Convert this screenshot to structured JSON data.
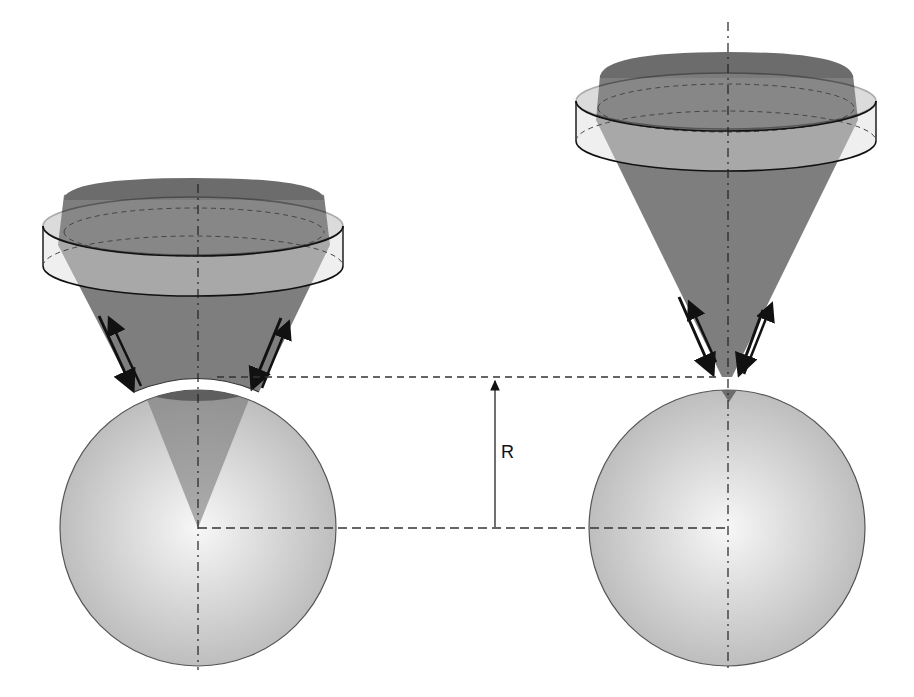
{
  "diagram": {
    "radius_label": "R",
    "colors": {
      "cone": "#6f6f6f",
      "cone_opacity": 0.85,
      "sphere_light": "#f4f4f4",
      "sphere_dark": "#b9b9b9",
      "cap": "#5a5a5a",
      "lens_fill": "#d8d8d8",
      "line": "#111111",
      "dash": "#333333"
    },
    "left_setup": {
      "name": "lens focused to sphere center",
      "axis_x": 198,
      "sphere": {
        "cx": 198,
        "cy": 528,
        "r": 138
      },
      "cone_apex": [
        198,
        528
      ],
      "lens": {
        "cx": 193,
        "top_cy": 226,
        "bottom_cy": 266,
        "rx": 150,
        "ry": 30
      }
    },
    "right_setup": {
      "name": "lens focused to sphere surface",
      "axis_x": 728,
      "sphere": {
        "cx": 727,
        "cy": 528,
        "r": 138
      },
      "cone_apex": [
        729,
        402
      ],
      "lens": {
        "cx": 726,
        "top_cy": 101,
        "bottom_cy": 141,
        "rx": 150,
        "ry": 30
      }
    },
    "dimension": {
      "x": 495,
      "y_top": 377,
      "y_bottom": 528,
      "label": "R"
    }
  }
}
